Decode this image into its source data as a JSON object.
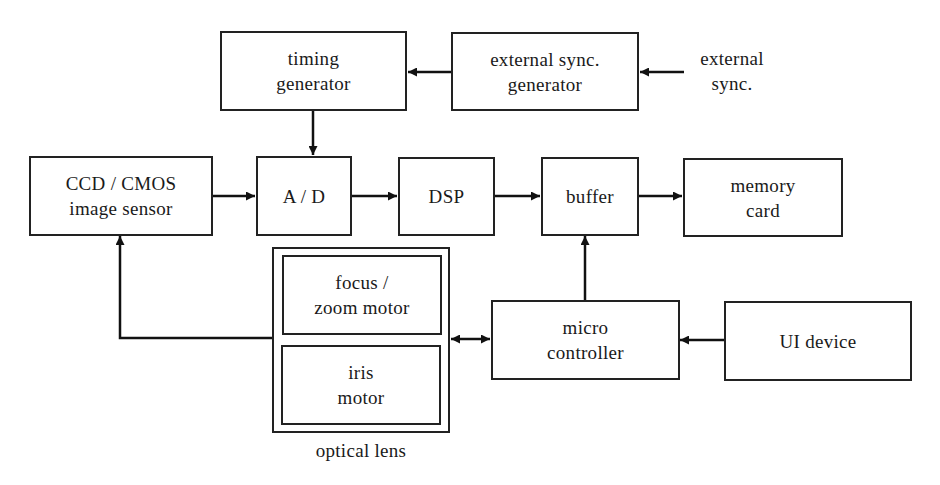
{
  "diagram": {
    "type": "block-diagram",
    "blocks": {
      "timing_generator": {
        "line1": "timing",
        "line2": "generator"
      },
      "external_sync_generator": {
        "line1": "external sync.",
        "line2": "generator"
      },
      "ccd_cmos": {
        "line1": "CCD / CMOS",
        "line2": "image sensor"
      },
      "ad": {
        "line1": "A / D"
      },
      "dsp": {
        "line1": "DSP"
      },
      "buffer": {
        "line1": "buffer"
      },
      "memory_card": {
        "line1": "memory",
        "line2": "card"
      },
      "focus_zoom_motor": {
        "line1": "focus /",
        "line2": "zoom motor"
      },
      "iris_motor": {
        "line1": "iris",
        "line2": "motor"
      },
      "micro_controller": {
        "line1": "micro",
        "line2": "controller"
      },
      "ui_device": {
        "line1": "UI device"
      }
    },
    "labels": {
      "external_sync": {
        "line1": "external",
        "line2": "sync."
      },
      "optical_lens": "optical lens"
    },
    "connections": [
      {
        "from": "external sync.",
        "to": "external sync. generator"
      },
      {
        "from": "external sync. generator",
        "to": "timing generator"
      },
      {
        "from": "timing generator",
        "to": "A / D"
      },
      {
        "from": "CCD / CMOS image sensor",
        "to": "A / D"
      },
      {
        "from": "A / D",
        "to": "DSP"
      },
      {
        "from": "DSP",
        "to": "buffer"
      },
      {
        "from": "buffer",
        "to": "memory card"
      },
      {
        "from": "micro controller",
        "to": "buffer"
      },
      {
        "from": "UI device",
        "to": "micro controller"
      },
      {
        "from": "micro controller",
        "to": "optical lens",
        "bidirectional": true
      },
      {
        "from": "optical lens",
        "to": "CCD / CMOS image sensor"
      }
    ]
  }
}
